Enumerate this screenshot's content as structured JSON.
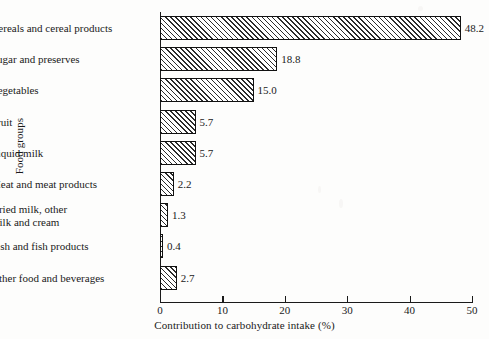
{
  "chart_data": {
    "type": "bar",
    "orientation": "horizontal",
    "title": "",
    "xlabel": "Contribution to carbohydrate intake (%)",
    "ylabel": "Food groups",
    "xlim": [
      0,
      50
    ],
    "xticks": [
      0,
      10,
      20,
      30,
      40,
      50
    ],
    "grid": false,
    "legend": null,
    "bar_style": {
      "fill": "diagonal-hatch",
      "edge_color": "#111111",
      "face_color": "#ffffff"
    },
    "categories": [
      "Cereals and cereal products",
      "Sugar and preserves",
      "Vegetables",
      "Fruit",
      "Liquid milk",
      "Meat and meat products",
      "Dried milk, other milk and cream",
      "Fish and fish products",
      "Other food and beverages"
    ],
    "values": [
      48.2,
      18.8,
      15.0,
      5.7,
      5.7,
      2.2,
      1.3,
      0.4,
      2.7
    ],
    "value_labels": [
      "48.2",
      "18.8",
      "15.0",
      "5.7",
      "5.7",
      "2.2",
      "1.3",
      "0.4",
      "2.7"
    ]
  },
  "axis": {
    "x_tick_labels": [
      "0",
      "10",
      "20",
      "30",
      "40",
      "50"
    ]
  },
  "category_label_lines": [
    [
      "Cereals and cereal products"
    ],
    [
      "Sugar and preserves"
    ],
    [
      "Vegetables"
    ],
    [
      "Fruit"
    ],
    [
      "Liquid milk"
    ],
    [
      "Meat and meat products"
    ],
    [
      "Dried milk, other",
      "milk and cream"
    ],
    [
      "Fish and fish products"
    ],
    [
      "Other food and beverages"
    ]
  ]
}
